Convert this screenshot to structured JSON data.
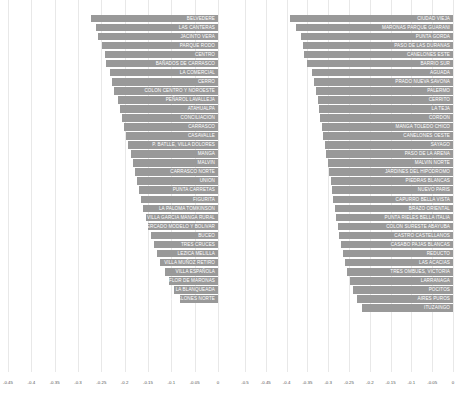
{
  "chart_data": [
    {
      "type": "bar",
      "orientation": "horizontal",
      "title": "",
      "xlabel": "",
      "ylabel": "",
      "xlim": [
        -0.45,
        0
      ],
      "grid": true,
      "legend": "none",
      "bar_color": "#999999",
      "xticks": [
        "-0.45",
        "-0.4",
        "-0.35",
        "-0.3",
        "-0.25",
        "-0.2",
        "-0.15",
        "-0.1",
        "-0.05",
        "0"
      ],
      "xtick_values": [
        -0.45,
        -0.4,
        -0.35,
        -0.3,
        -0.25,
        -0.2,
        -0.15,
        -0.1,
        -0.05,
        0
      ],
      "categories": [
        "BELVEDERE",
        "LAS CANTERAS",
        "JACINTO VERA",
        "PARQUE RODO",
        "CENTRO",
        "BAÑADOS DE CARRASCO",
        "LA COMERCIAL",
        "CERRO",
        "COLON CENTRO Y NOROESTE",
        "PEÑAROL LAVALLEJA",
        "ATAHUALPA",
        "CONCILIACION",
        "CARRASCO",
        "CASAVALLE",
        "P. BATLLE, VILLA DOLORES",
        "MANGA",
        "MALVIN",
        "CARRASCO NORTE",
        "UNION",
        "PUNTA CARRETAS",
        "FIGURITA",
        "LA PALOMA TOMKINSON",
        "VILLA GARCIA MANGA RURAL",
        "MERCADO MODELO Y BOLIVAR",
        "BUCEO",
        "TRES CRUCES",
        "LEZICA MELILLA",
        "VILLA MUÑOZ RETIRO",
        "VILLA ESPAÑOLA",
        "FLOR DE MARONAS",
        "LA BLANQUEADA",
        "CANELONES NORTE"
      ],
      "values": [
        -0.272,
        -0.262,
        -0.258,
        -0.249,
        -0.243,
        -0.239,
        -0.232,
        -0.228,
        -0.222,
        -0.214,
        -0.209,
        -0.205,
        -0.201,
        -0.197,
        -0.192,
        -0.187,
        -0.183,
        -0.178,
        -0.174,
        -0.169,
        -0.165,
        -0.16,
        -0.154,
        -0.149,
        -0.143,
        -0.137,
        -0.13,
        -0.124,
        -0.113,
        -0.104,
        -0.094,
        -0.082
      ]
    },
    {
      "type": "bar",
      "orientation": "horizontal",
      "title": "",
      "xlabel": "",
      "ylabel": "",
      "xlim": [
        -0.5,
        0
      ],
      "grid": true,
      "legend": "none",
      "bar_color": "#999999",
      "xticks": [
        "-0.5",
        "-0.45",
        "-0.4",
        "-0.35",
        "-0.3",
        "-0.25",
        "-0.2",
        "-0.15",
        "-0.1",
        "-0.05",
        "0"
      ],
      "xtick_values": [
        -0.5,
        -0.45,
        -0.4,
        -0.35,
        -0.3,
        -0.25,
        -0.2,
        -0.15,
        -0.1,
        -0.05,
        0
      ],
      "categories": [
        "CIUDAD VIEJA",
        "MARONAS PARQUE GUARANI",
        "PUNTA GORDA",
        "PASO DE LAS DURANAS",
        "CANELONES ESTE",
        "BARRIO SUR",
        "AGUADA",
        "PRADO NUEVA SAVONA",
        "PALERMO",
        "CERRITO",
        "LA TEJA",
        "CORDON",
        "MANGA TOLEDO CHICO",
        "CANELONES OESTE",
        "SAYAGO",
        "PASO DE LA ARENA",
        "MALVIN NORTE",
        "JARDINES DEL HIPODROMO",
        "PIEDRAS BLANCAS",
        "NUEVO PARIS",
        "CAPURRO BELLA VISTA",
        "BRAZO ORIENTAL",
        "PUNTA RIELES BELLA ITALIA",
        "COLON SURESTE ABAYUBA",
        "CASTRO CASTELLANOS",
        "CASABO PAJAS BLANCAS",
        "REDUCTO",
        "LAS ACACIAS",
        "TRES OMBUES, VICTORIA",
        "LARRANAGA",
        "POCITOS",
        "AIRES PUROS",
        "ITUZAINGO"
      ],
      "values": [
        -0.392,
        -0.378,
        -0.366,
        -0.36,
        -0.357,
        -0.352,
        -0.34,
        -0.334,
        -0.329,
        -0.325,
        -0.322,
        -0.319,
        -0.316,
        -0.312,
        -0.308,
        -0.305,
        -0.301,
        -0.298,
        -0.294,
        -0.291,
        -0.288,
        -0.284,
        -0.281,
        -0.277,
        -0.273,
        -0.269,
        -0.264,
        -0.259,
        -0.254,
        -0.247,
        -0.24,
        -0.231,
        -0.219
      ]
    }
  ]
}
